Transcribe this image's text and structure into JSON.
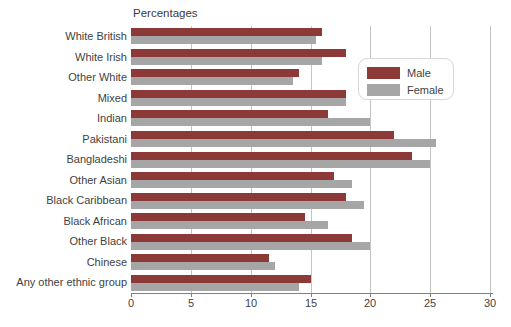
{
  "chart_data": {
    "type": "bar",
    "orientation": "horizontal",
    "title": "Percentages",
    "categories": [
      "White British",
      "White Irish",
      "Other White",
      "Mixed",
      "Indian",
      "Pakistani",
      "Bangladeshi",
      "Other Asian",
      "Black Caribbean",
      "Black African",
      "Other Black",
      "Chinese",
      "Any other ethnic group"
    ],
    "series": [
      {
        "name": "Male",
        "color": "#8b3a38",
        "values": [
          16,
          18,
          14,
          18,
          16.5,
          22,
          23.5,
          17,
          18,
          14.5,
          18.5,
          11.5,
          15
        ]
      },
      {
        "name": "Female",
        "color": "#a6a6a6",
        "values": [
          15.5,
          16,
          13.5,
          18,
          20,
          25.5,
          25,
          18.5,
          19.5,
          16.5,
          20,
          12,
          14
        ]
      }
    ],
    "xlim": [
      0,
      30
    ],
    "xticks": [
      0,
      5,
      10,
      15,
      20,
      25,
      30
    ],
    "grid": true,
    "legend_position": "inside-upper-right",
    "colors": {
      "gridline": "#c4c4c4",
      "axis": "#808080",
      "text": "#3f3f3f",
      "legend_border": "#d7d7d7",
      "background": "#ffffff"
    }
  }
}
